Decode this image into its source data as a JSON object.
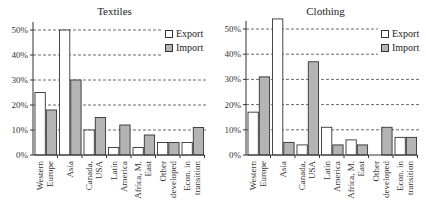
{
  "chart_data": [
    {
      "type": "bar",
      "title": "Textiles",
      "xlabel": "",
      "ylabel": "",
      "ylim": [
        0,
        50
      ],
      "yticks": [
        "0%",
        "10%",
        "20%",
        "30%",
        "40%",
        "50%"
      ],
      "grid": "dashed horizontal",
      "legend_position": "top-right",
      "categories": [
        "Western Europe",
        "Asia",
        "Canada, USA",
        "Latin America",
        "Africa, M. East",
        "Other developed",
        "Econ. in transition"
      ],
      "category_lines": [
        [
          "Western",
          "Europe"
        ],
        [
          "Asia"
        ],
        [
          "Canada,",
          "USA"
        ],
        [
          "Latin",
          "America"
        ],
        [
          "Africa, M.",
          "East"
        ],
        [
          "Other",
          "developed"
        ],
        [
          "Econ. in",
          "transition"
        ]
      ],
      "series": [
        {
          "name": "Export",
          "color": "#ffffff",
          "values": [
            25,
            50,
            10,
            3,
            3,
            5,
            5
          ]
        },
        {
          "name": "Import",
          "color": "#b4b4b4",
          "values": [
            18,
            30,
            15,
            12,
            8,
            5,
            11
          ]
        }
      ]
    },
    {
      "type": "bar",
      "title": "Clothing",
      "xlabel": "",
      "ylabel": "",
      "ylim": [
        0,
        50
      ],
      "yticks": [
        "0%",
        "10%",
        "20%",
        "30%",
        "40%",
        "50%"
      ],
      "grid": "dashed horizontal",
      "legend_position": "top-right",
      "categories": [
        "Western Europe",
        "Asia",
        "Canada, USA",
        "Latin America",
        "Africa, M. East",
        "Other developed",
        "Econ. in transition"
      ],
      "category_lines": [
        [
          "Western",
          "Europe"
        ],
        [
          "Asia"
        ],
        [
          "Canada,",
          "USA"
        ],
        [
          "Latin",
          "America"
        ],
        [
          "Africa, M.",
          "East"
        ],
        [
          "Other",
          "developed"
        ],
        [
          "Econ. in",
          "transition"
        ]
      ],
      "series": [
        {
          "name": "Export",
          "color": "#ffffff",
          "values": [
            17,
            54,
            4,
            11,
            6,
            0,
            7
          ]
        },
        {
          "name": "Import",
          "color": "#b4b4b4",
          "values": [
            31,
            5,
            37,
            4,
            4,
            11,
            7
          ]
        }
      ]
    }
  ],
  "panels": {
    "left": {
      "title": "Textiles",
      "legend": {
        "export": "Export",
        "import": "Import"
      }
    },
    "right": {
      "title": "Clothing",
      "legend": {
        "export": "Export",
        "import": "Import"
      }
    }
  }
}
